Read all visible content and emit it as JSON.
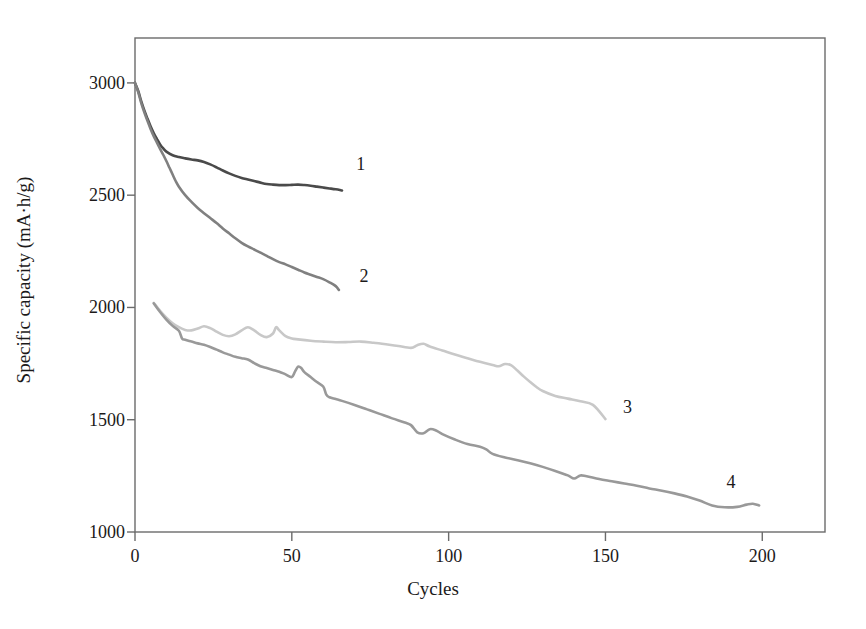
{
  "chart_data": {
    "type": "line",
    "title": "",
    "xlabel": "Cycles",
    "ylabel": "Specific capacity (mA·h/g)",
    "xlim": [
      0,
      220
    ],
    "ylim": [
      1000,
      3200
    ],
    "xticks": [
      0,
      50,
      100,
      150,
      200
    ],
    "xtick_labels": [
      "0",
      "50",
      "100",
      "150",
      "200"
    ],
    "yticks": [
      1000,
      1500,
      2000,
      2500,
      3000
    ],
    "ytick_labels": [
      "1000",
      "1500",
      "2000",
      "2500",
      "3000"
    ],
    "grid": false,
    "legend": "inline-end-of-curve-labels",
    "frame": "box",
    "series": [
      {
        "name": "1",
        "label": "1",
        "color": "#4a4a4a",
        "label_position": {
          "x": 72,
          "y": 2640
        },
        "points": [
          [
            0,
            3000
          ],
          [
            1,
            2965
          ],
          [
            2,
            2918
          ],
          [
            3,
            2876
          ],
          [
            4,
            2840
          ],
          [
            5,
            2806
          ],
          [
            6,
            2776
          ],
          [
            7,
            2750
          ],
          [
            8,
            2726
          ],
          [
            9,
            2708
          ],
          [
            10,
            2694
          ],
          [
            12,
            2678
          ],
          [
            14,
            2670
          ],
          [
            16,
            2664
          ],
          [
            18,
            2659
          ],
          [
            20,
            2655
          ],
          [
            22,
            2648
          ],
          [
            24,
            2637
          ],
          [
            26,
            2624
          ],
          [
            28,
            2610
          ],
          [
            30,
            2597
          ],
          [
            32,
            2586
          ],
          [
            34,
            2577
          ],
          [
            36,
            2570
          ],
          [
            38,
            2563
          ],
          [
            40,
            2556
          ],
          [
            42,
            2550
          ],
          [
            44,
            2547
          ],
          [
            46,
            2545
          ],
          [
            48,
            2545
          ],
          [
            50,
            2546
          ],
          [
            52,
            2547
          ],
          [
            54,
            2545
          ],
          [
            56,
            2542
          ],
          [
            58,
            2538
          ],
          [
            60,
            2534
          ],
          [
            62,
            2530
          ],
          [
            64,
            2526
          ],
          [
            66,
            2521
          ]
        ]
      },
      {
        "name": "2",
        "label": "2",
        "color": "#808080",
        "label_position": {
          "x": 73,
          "y": 2140
        },
        "points": [
          [
            0,
            3000
          ],
          [
            1,
            2960
          ],
          [
            2,
            2910
          ],
          [
            3,
            2868
          ],
          [
            4,
            2830
          ],
          [
            5,
            2794
          ],
          [
            6,
            2762
          ],
          [
            7,
            2734
          ],
          [
            8,
            2706
          ],
          [
            9,
            2680
          ],
          [
            10,
            2652
          ],
          [
            11,
            2622
          ],
          [
            12,
            2592
          ],
          [
            13,
            2562
          ],
          [
            14,
            2538
          ],
          [
            16,
            2500
          ],
          [
            18,
            2470
          ],
          [
            20,
            2443
          ],
          [
            22,
            2420
          ],
          [
            24,
            2398
          ],
          [
            26,
            2376
          ],
          [
            28,
            2352
          ],
          [
            30,
            2330
          ],
          [
            32,
            2308
          ],
          [
            34,
            2288
          ],
          [
            36,
            2272
          ],
          [
            38,
            2258
          ],
          [
            40,
            2244
          ],
          [
            42,
            2230
          ],
          [
            44,
            2215
          ],
          [
            46,
            2202
          ],
          [
            48,
            2192
          ],
          [
            50,
            2180
          ],
          [
            52,
            2168
          ],
          [
            54,
            2156
          ],
          [
            56,
            2146
          ],
          [
            58,
            2136
          ],
          [
            60,
            2126
          ],
          [
            62,
            2112
          ],
          [
            64,
            2095
          ],
          [
            65,
            2078
          ]
        ]
      },
      {
        "name": "3",
        "label": "3",
        "color": "#c8c8c8",
        "label_position": {
          "x": 157,
          "y": 1555
        },
        "points": [
          [
            6,
            2020
          ],
          [
            8,
            1985
          ],
          [
            10,
            1955
          ],
          [
            12,
            1930
          ],
          [
            14,
            1912
          ],
          [
            16,
            1900
          ],
          [
            18,
            1898
          ],
          [
            20,
            1906
          ],
          [
            22,
            1916
          ],
          [
            24,
            1908
          ],
          [
            26,
            1892
          ],
          [
            28,
            1878
          ],
          [
            30,
            1872
          ],
          [
            32,
            1880
          ],
          [
            34,
            1898
          ],
          [
            36,
            1912
          ],
          [
            38,
            1898
          ],
          [
            40,
            1878
          ],
          [
            42,
            1868
          ],
          [
            44,
            1884
          ],
          [
            45,
            1912
          ],
          [
            46,
            1898
          ],
          [
            48,
            1872
          ],
          [
            50,
            1862
          ],
          [
            52,
            1858
          ],
          [
            56,
            1852
          ],
          [
            60,
            1848
          ],
          [
            64,
            1845
          ],
          [
            68,
            1846
          ],
          [
            72,
            1848
          ],
          [
            76,
            1843
          ],
          [
            80,
            1836
          ],
          [
            84,
            1828
          ],
          [
            88,
            1820
          ],
          [
            90,
            1832
          ],
          [
            92,
            1838
          ],
          [
            94,
            1826
          ],
          [
            98,
            1808
          ],
          [
            102,
            1790
          ],
          [
            106,
            1774
          ],
          [
            110,
            1758
          ],
          [
            114,
            1744
          ],
          [
            116,
            1738
          ],
          [
            118,
            1748
          ],
          [
            120,
            1742
          ],
          [
            122,
            1718
          ],
          [
            124,
            1692
          ],
          [
            126,
            1668
          ],
          [
            128,
            1646
          ],
          [
            130,
            1628
          ],
          [
            134,
            1606
          ],
          [
            138,
            1594
          ],
          [
            142,
            1582
          ],
          [
            146,
            1566
          ],
          [
            150,
            1503
          ]
        ]
      },
      {
        "name": "4",
        "label": "4",
        "color": "#999999",
        "label_position": {
          "x": 190,
          "y": 1222
        },
        "points": [
          [
            6,
            2018
          ],
          [
            8,
            1980
          ],
          [
            10,
            1946
          ],
          [
            12,
            1918
          ],
          [
            14,
            1896
          ],
          [
            15,
            1862
          ],
          [
            16,
            1856
          ],
          [
            18,
            1848
          ],
          [
            20,
            1840
          ],
          [
            22,
            1834
          ],
          [
            24,
            1824
          ],
          [
            26,
            1812
          ],
          [
            28,
            1800
          ],
          [
            30,
            1790
          ],
          [
            32,
            1780
          ],
          [
            34,
            1774
          ],
          [
            36,
            1768
          ],
          [
            38,
            1752
          ],
          [
            40,
            1738
          ],
          [
            42,
            1730
          ],
          [
            44,
            1722
          ],
          [
            46,
            1714
          ],
          [
            48,
            1702
          ],
          [
            50,
            1690
          ],
          [
            51,
            1714
          ],
          [
            52,
            1736
          ],
          [
            53,
            1730
          ],
          [
            54,
            1712
          ],
          [
            56,
            1690
          ],
          [
            58,
            1668
          ],
          [
            60,
            1648
          ],
          [
            61,
            1612
          ],
          [
            62,
            1600
          ],
          [
            64,
            1592
          ],
          [
            66,
            1584
          ],
          [
            70,
            1566
          ],
          [
            74,
            1546
          ],
          [
            78,
            1526
          ],
          [
            82,
            1506
          ],
          [
            86,
            1488
          ],
          [
            88,
            1476
          ],
          [
            90,
            1444
          ],
          [
            92,
            1440
          ],
          [
            94,
            1458
          ],
          [
            96,
            1452
          ],
          [
            98,
            1436
          ],
          [
            102,
            1412
          ],
          [
            106,
            1392
          ],
          [
            110,
            1380
          ],
          [
            112,
            1368
          ],
          [
            114,
            1348
          ],
          [
            118,
            1332
          ],
          [
            122,
            1320
          ],
          [
            126,
            1306
          ],
          [
            130,
            1290
          ],
          [
            134,
            1272
          ],
          [
            138,
            1252
          ],
          [
            140,
            1238
          ],
          [
            142,
            1252
          ],
          [
            144,
            1248
          ],
          [
            148,
            1236
          ],
          [
            152,
            1226
          ],
          [
            156,
            1216
          ],
          [
            160,
            1206
          ],
          [
            164,
            1194
          ],
          [
            168,
            1184
          ],
          [
            172,
            1172
          ],
          [
            176,
            1158
          ],
          [
            180,
            1140
          ],
          [
            184,
            1118
          ],
          [
            188,
            1110
          ],
          [
            192,
            1112
          ],
          [
            195,
            1122
          ],
          [
            197,
            1126
          ],
          [
            199,
            1118
          ]
        ]
      }
    ]
  },
  "plot_geometry": {
    "left_px": 135,
    "right_px": 825,
    "top_px": 38,
    "bottom_px": 532,
    "x_min": 0,
    "x_max": 220,
    "y_min": 1000,
    "y_max": 3200
  },
  "colors": {
    "axis": "#6b6b6b",
    "text": "#1c1a1a",
    "background": "#ffffff"
  }
}
